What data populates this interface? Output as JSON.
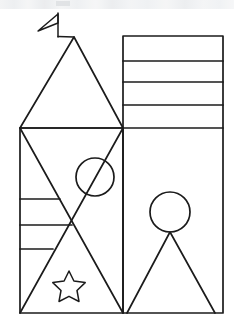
{
  "document": {
    "title": "Line drawing of two houses with geometric shapes",
    "kind": "black-and-white line art",
    "background_color": "#ffffff",
    "stroke_color": "#1b1b1b",
    "canvas": {
      "width": 234,
      "height": 324
    },
    "scan_artifact": {
      "present": true,
      "description": "faint grey scanner band across top edge",
      "color": "#f0f1f3",
      "x": 0,
      "y": 0,
      "width": 234,
      "height": 9
    }
  },
  "figure": {
    "caption": "Two adjoining buildings outlined in black on white. The left building has a tall triangular roof with a pennant flag, an X of crossing diagonals, an outlined circle, horizontal ladder stripes at the left, and a five-pointed star near the bottom. The right building is a tall rectangle with four horizontal stripes across its upper portion and a circle above a wide triangle in its lower portion.",
    "shapes": [
      {
        "name": "flag-pennant",
        "type": "triangle",
        "description": "small pennant flag pointing left at the top of the flagpole",
        "points": "58,23 38,31 58,14"
      },
      {
        "name": "flagpole",
        "type": "line",
        "description": "vertical pole from pennant down to roof apex",
        "points": "58,14 58,37"
      },
      {
        "name": "roof-triangle-left",
        "type": "triangle",
        "description": "large triangular roof of the left house",
        "points": "74,37 20,128 123,128"
      },
      {
        "name": "flag-stem-to-apex",
        "type": "line",
        "description": "short segment linking flagpole base to roof apex",
        "points": "58,37 74,37"
      },
      {
        "name": "left-house-body",
        "type": "rectangle",
        "description": "main rectangular body of the left house",
        "x": 20,
        "y": 128,
        "width": 103,
        "height": 185
      },
      {
        "name": "diagonal-top-left-to-bottom-right",
        "type": "line",
        "description": "diagonal of the X running from upper-left corner to lower-right corner of left body",
        "points": "20,128 123,313"
      },
      {
        "name": "diagonal-top-right-to-bottom-left",
        "type": "line",
        "description": "diagonal of the X running from upper-right corner to lower-left corner of left body",
        "points": "123,128 20,313"
      },
      {
        "name": "circle-left-house",
        "type": "circle",
        "description": "outlined circle overlapping the right diagonal in the upper half of the left house",
        "cx": 95,
        "cy": 177,
        "r": 19
      },
      {
        "name": "ladder-stripe-1",
        "type": "line",
        "description": "first horizontal stripe on the lower-left of the left house",
        "points": "20,199 60,199"
      },
      {
        "name": "ladder-stripe-2",
        "type": "line",
        "description": "second horizontal stripe on the lower-left of the left house",
        "points": "20,225 72,225"
      },
      {
        "name": "ladder-stripe-3",
        "type": "line",
        "description": "third horizontal stripe on the lower-left of the left house",
        "points": "20,249 53,249"
      },
      {
        "name": "star-five-point",
        "type": "star",
        "description": "five-pointed star outline near the bottom of the left house",
        "cx": 69,
        "cy": 287,
        "outer_r": 16,
        "inner_r": 6.6,
        "points": 5
      },
      {
        "name": "right-building-body",
        "type": "rectangle",
        "description": "tall rectangular right building",
        "x": 123,
        "y": 36,
        "width": 100,
        "height": 277
      },
      {
        "name": "right-stripe-1",
        "type": "line",
        "description": "first horizontal stripe across the right building",
        "points": "123,61 223,61"
      },
      {
        "name": "right-stripe-2",
        "type": "line",
        "description": "second horizontal stripe across the right building",
        "points": "123,82 223,82"
      },
      {
        "name": "right-stripe-3",
        "type": "line",
        "description": "third horizontal stripe across the right building",
        "points": "123,105 223,105"
      },
      {
        "name": "right-stripe-4",
        "type": "line",
        "description": "fourth horizontal stripe, shared eaves line with left house",
        "points": "123,128 223,128"
      },
      {
        "name": "circle-right-building",
        "type": "circle",
        "description": "outlined circle sitting atop the apex of the lower triangle",
        "cx": 170,
        "cy": 212,
        "r": 20
      },
      {
        "name": "triangle-right-lower",
        "type": "triangle-open",
        "description": "wide triangle whose apex meets the circle, legs reaching the bottom corners",
        "points": "127,313 170,232 215,313"
      }
    ],
    "counts": {
      "circles": 2,
      "triangles": 3,
      "stars": 1,
      "rectangles": 2,
      "horizontal_stripes": 7
    }
  }
}
